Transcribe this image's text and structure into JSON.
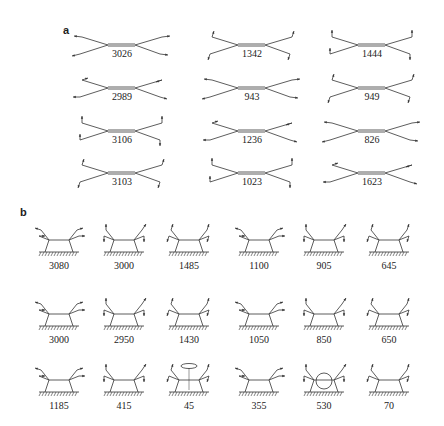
{
  "panel_a": {
    "label": "a",
    "modes": [
      {
        "value": "3026",
        "kind": "stretch-out"
      },
      {
        "value": "1342",
        "kind": "rock-diag"
      },
      {
        "value": "1444",
        "kind": "scissor-right"
      },
      {
        "value": "2989",
        "kind": "stretch-mixed"
      },
      {
        "value": "943",
        "kind": "wag-vertical"
      },
      {
        "value": "949",
        "kind": "wag-up"
      },
      {
        "value": "3106",
        "kind": "stretch-asym"
      },
      {
        "value": "1236",
        "kind": "twist"
      },
      {
        "value": "826",
        "kind": "rock-up"
      },
      {
        "value": "3103",
        "kind": "stretch-asym2"
      },
      {
        "value": "1023",
        "kind": "scissor-left"
      },
      {
        "value": "1623",
        "kind": "cc-stretch"
      }
    ]
  },
  "panel_b": {
    "label": "b",
    "modes": [
      {
        "value": "3080"
      },
      {
        "value": "3000"
      },
      {
        "value": "1485"
      },
      {
        "value": "1100"
      },
      {
        "value": "905"
      },
      {
        "value": "645"
      },
      {
        "value": "3000"
      },
      {
        "value": "2950"
      },
      {
        "value": "1430"
      },
      {
        "value": "1050"
      },
      {
        "value": "850"
      },
      {
        "value": "650"
      },
      {
        "value": "1185"
      },
      {
        "value": "415"
      },
      {
        "value": "45"
      },
      {
        "value": "355"
      },
      {
        "value": "530"
      },
      {
        "value": "70"
      }
    ]
  },
  "colors": {
    "line": "#333333",
    "text": "#222222",
    "background": "#ffffff"
  }
}
